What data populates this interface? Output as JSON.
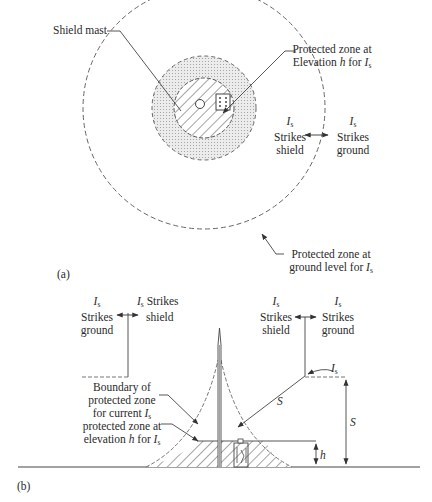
{
  "figure": {
    "panel_a": {
      "tag": "(a)",
      "shield_mast_label": "Shield mast",
      "protected_zone_elevation": {
        "line1": "Protected zone at",
        "line2_prefix": "Elevation ",
        "line2_var": "h",
        "line2_mid": " for ",
        "line2_sym": "I",
        "line2_sub": "s"
      },
      "strikes_shield": {
        "sym": "I",
        "sub": "s",
        "line1": "Strikes",
        "line2": "shield"
      },
      "strikes_ground": {
        "sym": "I",
        "sub": "s",
        "line1": "Strikes",
        "line2": "ground"
      },
      "protected_zone_ground": {
        "line1": "Protected zone at",
        "line2_prefix": "ground level for ",
        "line2_sym": "I",
        "line2_sub": "s"
      }
    },
    "panel_b": {
      "tag": "(b)",
      "left_strikes_ground": {
        "sym": "I",
        "sub": "s",
        "line1": "Strikes",
        "line2": "ground"
      },
      "left_strikes_shield": {
        "sym": "I",
        "sub": "s",
        "text": "Strikes",
        "line2": "shield"
      },
      "right_strikes_shield": {
        "sym": "I",
        "sub": "s",
        "line1": "Strikes",
        "line2": "shield"
      },
      "right_strikes_ground": {
        "sym": "I",
        "sub": "s",
        "line1": "Strikes",
        "line2": "ground"
      },
      "boundary_label": {
        "line1": "Boundary of",
        "line2": "protected zone",
        "line3_prefix": "for current ",
        "line3_sym": "I",
        "line3_sub": "s"
      },
      "elevation_zone_label": {
        "line1": "protected zone at",
        "line2_prefix": "elevation ",
        "line2_var": "h",
        "line2_mid": " for ",
        "line2_sym": "I",
        "line2_sub": "s"
      },
      "current_label": {
        "sym": "I",
        "sub": "s"
      },
      "radius_label": "S",
      "height_label": "S",
      "elevation_label": "h"
    }
  }
}
